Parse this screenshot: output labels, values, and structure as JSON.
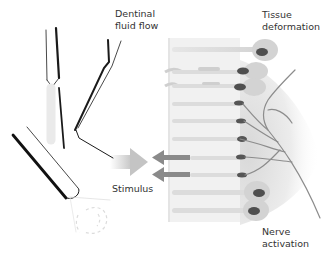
{
  "diagram": {
    "labels": {
      "dentinal_fluid_flow": "Dentinal\nfluid flow",
      "tissue_deformation": "Tissue\ndeformation",
      "stimulus": "Stimulus",
      "nerve_activation": "Nerve\nactivation"
    },
    "colors": {
      "background": "#ffffff",
      "text": "#333333",
      "tubule_band": "#ececec",
      "tubule_fill": "#d9d9d9",
      "odontoblast_body": "#d2d2d2",
      "nucleus": "#555555",
      "arrow_flow": "#8a8a8a",
      "stimulus_arrow": "#c8c8c8",
      "nerve": "#8c8c8c",
      "pulp_shade": "#e2e2e2",
      "instrument_line": "#1a1a1a"
    },
    "tubules": [
      {
        "y": 50,
        "cell": "large",
        "flow": false
      },
      {
        "y": 72,
        "cell": "medium",
        "flow": false,
        "deformed": true
      },
      {
        "y": 86,
        "cell": "medium",
        "flow": false,
        "deformed": true
      },
      {
        "y": 104,
        "cell": "small",
        "flow": false
      },
      {
        "y": 121,
        "cell": "small",
        "flow": false
      },
      {
        "y": 138,
        "cell": "small",
        "flow": false
      },
      {
        "y": 157,
        "cell": "small",
        "flow": true
      },
      {
        "y": 174,
        "cell": "small",
        "flow": true
      },
      {
        "y": 192,
        "cell": "large",
        "flow": false
      },
      {
        "y": 210,
        "cell": "large",
        "flow": false
      }
    ],
    "instruments": [
      {
        "name": "explorer-probe"
      },
      {
        "name": "curved-probe"
      },
      {
        "name": "air-syringe"
      }
    ]
  }
}
